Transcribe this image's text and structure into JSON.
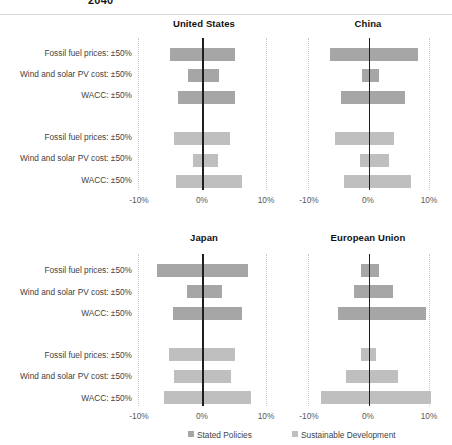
{
  "figure": {
    "title": "2040",
    "colors": {
      "stated": "#a6a6a6",
      "sustainable": "#bfbfbf",
      "zero_axis": "#1f1f1f",
      "gridline": "#c9c9c9"
    }
  },
  "legend": {
    "position": "bottom",
    "items": [
      {
        "label": "Stated Policies",
        "color": "#a6a6a6"
      },
      {
        "label": "Sustainable Development",
        "color": "#bfbfbf"
      }
    ]
  },
  "axis": {
    "ticks": [
      "-10%",
      "0%",
      "10%"
    ],
    "min": -10,
    "max": 10
  },
  "rows": {
    "labels": [
      "Fossil fuel prices: ±50%",
      "Wind and solar PV cost: ±50%",
      "WACC: ±50%",
      "Fossil fuel prices: ±50%",
      "Wind and solar PV cost: ±50%",
      "WACC: ±50%"
    ]
  },
  "panels": [
    {
      "id": "united-states",
      "title": "United States"
    },
    {
      "id": "china",
      "title": "China"
    },
    {
      "id": "japan",
      "title": "Japan"
    },
    {
      "id": "european-union",
      "title": "European Union"
    }
  ],
  "chart_data": {
    "type": "bar",
    "title": "2040",
    "subtype": "tornado / sensitivity (floating horizontal bars)",
    "xlabel": "",
    "ylabel": "",
    "xlim": [
      -10,
      10
    ],
    "xticks": [
      -10,
      0,
      10
    ],
    "xtick_labels": [
      "-10%",
      "0%",
      "10%"
    ],
    "grid": "vertical dotted at -10% and +10%, solid at 0%",
    "legend_position": "bottom",
    "units": "percent change",
    "categories": [
      "Fossil fuel prices: ±50%",
      "Wind and solar PV cost: ±50%",
      "WACC: ±50%"
    ],
    "series": [
      {
        "name": "Stated Policies",
        "color": "#a6a6a6"
      },
      {
        "name": "Sustainable Development",
        "color": "#bfbfbf"
      }
    ],
    "panels": [
      {
        "name": "United States",
        "data": [
          {
            "category": "Fossil fuel prices: ±50%",
            "series": "Stated Policies",
            "low": -5.0,
            "high": 5.2
          },
          {
            "category": "Wind and solar PV cost: ±50%",
            "series": "Stated Policies",
            "low": -2.2,
            "high": 2.7
          },
          {
            "category": "WACC: ±50%",
            "series": "Stated Policies",
            "low": -3.7,
            "high": 5.2
          },
          {
            "category": "Fossil fuel prices: ±50%",
            "series": "Sustainable Development",
            "low": -4.3,
            "high": 4.3
          },
          {
            "category": "Wind and solar PV cost: ±50%",
            "series": "Sustainable Development",
            "low": -1.4,
            "high": 2.5
          },
          {
            "category": "WACC: ±50%",
            "series": "Sustainable Development",
            "low": -4.0,
            "high": 6.2
          }
        ]
      },
      {
        "name": "China",
        "data": [
          {
            "category": "Fossil fuel prices: ±50%",
            "series": "Stated Policies",
            "low": -6.3,
            "high": 8.2
          },
          {
            "category": "Wind and solar PV cost: ±50%",
            "series": "Stated Policies",
            "low": -1.0,
            "high": 1.7
          },
          {
            "category": "WACC: ±50%",
            "series": "Stated Policies",
            "low": -4.6,
            "high": 6.1
          },
          {
            "category": "Fossil fuel prices: ±50%",
            "series": "Sustainable Development",
            "low": -5.6,
            "high": 4.2
          },
          {
            "category": "Wind and solar PV cost: ±50%",
            "series": "Sustainable Development",
            "low": -1.4,
            "high": 3.4
          },
          {
            "category": "WACC: ±50%",
            "series": "Sustainable Development",
            "low": -4.0,
            "high": 7.0
          }
        ]
      },
      {
        "name": "Japan",
        "data": [
          {
            "category": "Fossil fuel prices: ±50%",
            "series": "Stated Policies",
            "low": -7.0,
            "high": 7.2
          },
          {
            "category": "Wind and solar PV cost: ±50%",
            "series": "Stated Policies",
            "low": -2.4,
            "high": 3.1
          },
          {
            "category": "WACC: ±50%",
            "series": "Stated Policies",
            "low": -4.5,
            "high": 6.2
          },
          {
            "category": "Fossil fuel prices: ±50%",
            "series": "Sustainable Development",
            "low": -5.2,
            "high": 5.2
          },
          {
            "category": "Wind and solar PV cost: ±50%",
            "series": "Sustainable Development",
            "low": -4.4,
            "high": 4.6
          },
          {
            "category": "WACC: ±50%",
            "series": "Sustainable Development",
            "low": -6.0,
            "high": 7.6
          }
        ]
      },
      {
        "name": "European Union",
        "data": [
          {
            "category": "Fossil fuel prices: ±50%",
            "series": "Stated Policies",
            "low": -1.2,
            "high": 1.8
          },
          {
            "category": "Wind and solar PV cost: ±50%",
            "series": "Stated Policies",
            "low": -2.4,
            "high": 4.0
          },
          {
            "category": "WACC: ±50%",
            "series": "Stated Policies",
            "low": -5.1,
            "high": 9.5
          },
          {
            "category": "Fossil fuel prices: ±50%",
            "series": "Sustainable Development",
            "low": -1.3,
            "high": 1.2
          },
          {
            "category": "Wind and solar PV cost: ±50%",
            "series": "Sustainable Development",
            "low": -3.8,
            "high": 4.8
          },
          {
            "category": "WACC: ±50%",
            "series": "Sustainable Development",
            "low": -7.8,
            "high": 10.3
          }
        ]
      }
    ]
  }
}
